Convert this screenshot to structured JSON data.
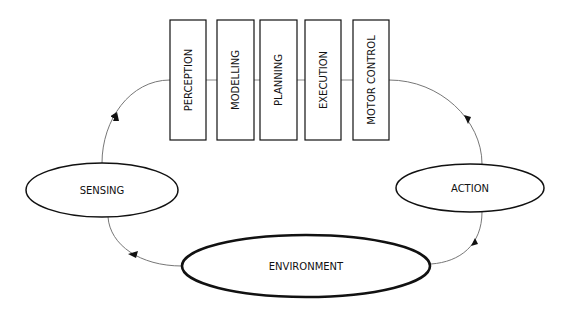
{
  "diagram": {
    "stages": [
      {
        "label": "PERCEPTION"
      },
      {
        "label": "MODELLING"
      },
      {
        "label": "PLANNING"
      },
      {
        "label": "EXECUTION"
      },
      {
        "label": "MOTOR CONTROL"
      }
    ],
    "nodes": {
      "sensing": "SENSING",
      "action": "ACTION",
      "environment": "ENVIRONMENT"
    },
    "colors": {
      "stroke": "#111111",
      "connector": "#777777",
      "background": "#ffffff"
    }
  }
}
